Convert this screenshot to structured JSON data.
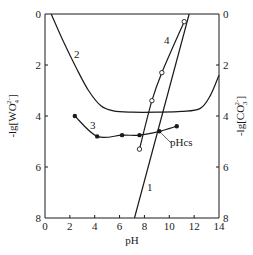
{
  "chart_data": {
    "type": "line",
    "title": "",
    "xlabel": "pH",
    "ylabel_left": "-lg[WO4^2-]",
    "ylabel_right": "-lg[CO3^2-]",
    "xlim": [
      0,
      14
    ],
    "ylim": [
      0,
      8
    ],
    "y_inverted": true,
    "grid": false,
    "x_ticks": [
      "0",
      "2",
      "4",
      "6",
      "8",
      "10",
      "12",
      "14"
    ],
    "y_ticks_left": [
      "0",
      "2",
      "4",
      "6",
      "8"
    ],
    "y_ticks_right": [
      "0",
      "2",
      "4",
      "6",
      "8"
    ],
    "series": [
      {
        "name": "1",
        "marker": "none",
        "x": [
          7.2,
          11.6
        ],
        "y": [
          8.0,
          0.0
        ]
      },
      {
        "name": "2",
        "marker": "none",
        "x": [
          0.5,
          1.5,
          2.5,
          3.5,
          4.5,
          5.5,
          7,
          9,
          11,
          12.5,
          13.3,
          14
        ],
        "y": [
          0.0,
          1.1,
          2.1,
          3.0,
          3.6,
          3.8,
          3.85,
          3.85,
          3.82,
          3.7,
          3.2,
          2.4
        ]
      },
      {
        "name": "3",
        "marker": "filled-circle",
        "x": [
          2.4,
          4.2,
          6.2,
          7.6,
          9.2,
          10.6
        ],
        "y": [
          4.0,
          4.8,
          4.75,
          4.75,
          4.6,
          4.4
        ]
      },
      {
        "name": "4",
        "marker": "open-circle",
        "x": [
          7.6,
          8.6,
          9.4,
          11.2
        ],
        "y": [
          5.3,
          3.4,
          2.3,
          0.3
        ]
      }
    ],
    "annotations": [
      {
        "text": "pHcs",
        "x": 9.2,
        "y": 4.6,
        "note": "intersection of curve 1 and curve 3"
      }
    ]
  },
  "labels": {
    "xlabel": "pH",
    "ylabel_left_prefix": "-lg[WO",
    "ylabel_left_sub": "4",
    "ylabel_left_sup": "2-",
    "ylabel_left_suffix": "]",
    "ylabel_right_prefix": "-lg[CO",
    "ylabel_right_sub": "3",
    "ylabel_right_sup": "2-",
    "ylabel_right_suffix": "]",
    "curve1": "1",
    "curve2": "2",
    "curve3": "3",
    "curve4": "4",
    "pHcs": "pHcs"
  }
}
